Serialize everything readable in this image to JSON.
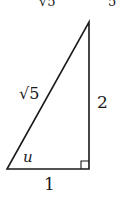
{
  "figure": {
    "type": "right-triangle",
    "top_cutoff_text": [
      "√5",
      "5"
    ],
    "labels": {
      "hypotenuse": "√5",
      "opposite": "2",
      "adjacent": "1",
      "angle": "u"
    },
    "right_angle_marker": true,
    "line_color": "#1a1a1a"
  }
}
